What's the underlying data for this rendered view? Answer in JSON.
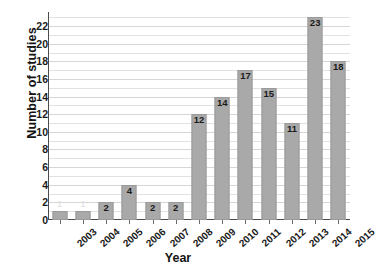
{
  "chart_data": {
    "type": "bar",
    "title": "",
    "xlabel": "Year",
    "ylabel": "Number of studies",
    "categories": [
      "2003",
      "2004",
      "2005",
      "2006",
      "2007",
      "2008",
      "2009",
      "2010",
      "2011",
      "2012",
      "2013",
      "2014",
      "2015"
    ],
    "values": [
      1,
      1,
      2,
      4,
      2,
      2,
      12,
      14,
      17,
      15,
      11,
      23,
      18
    ],
    "data_labels": [
      "1",
      "1",
      "2",
      "4",
      "2",
      "2",
      "12",
      "14",
      "17",
      "15",
      "11",
      "23",
      "18"
    ],
    "ylim": [
      0,
      23
    ],
    "ytick_labels": [
      "0",
      "2",
      "4",
      "6",
      "8",
      "10",
      "12",
      "14",
      "16",
      "18",
      "20",
      "22"
    ],
    "ytick_values": [
      0,
      2,
      4,
      6,
      8,
      10,
      12,
      14,
      16,
      18,
      20,
      22
    ],
    "grid": "horizontal",
    "grid_step": 1,
    "legend": "none",
    "bar_color": "#a9a9a9",
    "axis_color": "#4d4d4d",
    "grid_color": "#e2e2e2",
    "text_color": "#1a1a1a",
    "background": "#ffffff"
  }
}
